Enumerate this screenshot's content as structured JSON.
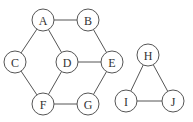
{
  "graph": {
    "nodes": [
      {
        "id": "A",
        "label": "A",
        "x": 43,
        "y": 20
      },
      {
        "id": "B",
        "label": "B",
        "x": 88,
        "y": 20
      },
      {
        "id": "C",
        "label": "C",
        "x": 15,
        "y": 62
      },
      {
        "id": "D",
        "label": "D",
        "x": 67,
        "y": 62
      },
      {
        "id": "E",
        "label": "E",
        "x": 112,
        "y": 62
      },
      {
        "id": "F",
        "label": "F",
        "x": 43,
        "y": 104
      },
      {
        "id": "G",
        "label": "G",
        "x": 88,
        "y": 104
      },
      {
        "id": "H",
        "label": "H",
        "x": 148,
        "y": 55
      },
      {
        "id": "I",
        "label": "I",
        "x": 126,
        "y": 101
      },
      {
        "id": "J",
        "label": "J",
        "x": 173,
        "y": 101
      }
    ],
    "edges": [
      [
        "A",
        "B"
      ],
      [
        "A",
        "C"
      ],
      [
        "A",
        "D"
      ],
      [
        "B",
        "E"
      ],
      [
        "C",
        "F"
      ],
      [
        "D",
        "E"
      ],
      [
        "D",
        "F"
      ],
      [
        "E",
        "G"
      ],
      [
        "F",
        "G"
      ],
      [
        "H",
        "I"
      ],
      [
        "H",
        "J"
      ],
      [
        "I",
        "J"
      ]
    ],
    "node_radius": 11
  }
}
